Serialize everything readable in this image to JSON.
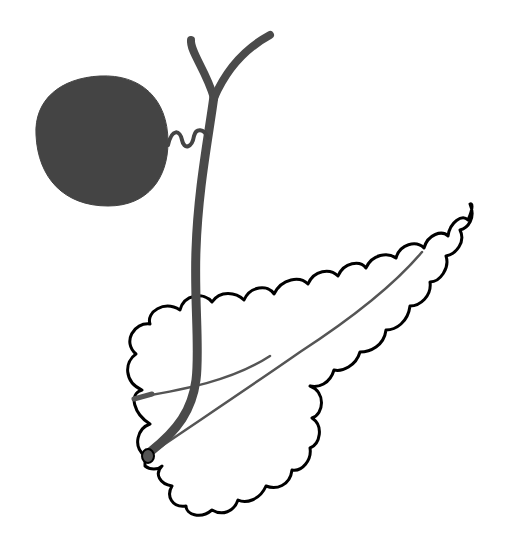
{
  "diagram": {
    "type": "anatomical-illustration",
    "subject": "Hepatobiliary and pancreatic duct system",
    "labels": [],
    "structures": [
      {
        "id": "gallbladder",
        "name": "Gallbladder",
        "style": "filled",
        "color": "#444444"
      },
      {
        "id": "cystic-duct",
        "name": "Cystic duct",
        "style": "wavy-line",
        "color": "#444444"
      },
      {
        "id": "hepatic-ducts",
        "name": "Right and left hepatic ducts",
        "style": "thick-line",
        "color": "#4a4a4a"
      },
      {
        "id": "common-bile-duct",
        "name": "Common bile duct",
        "style": "thick-line",
        "color": "#4a4a4a"
      },
      {
        "id": "pancreas",
        "name": "Pancreas",
        "style": "scalloped-outline",
        "stroke": "#000000",
        "fill": "#ffffff"
      },
      {
        "id": "main-pancreatic-duct",
        "name": "Main pancreatic duct",
        "style": "thin-line",
        "color": "#555555"
      },
      {
        "id": "accessory-pancreatic-duct",
        "name": "Accessory pancreatic duct",
        "style": "thin-line",
        "color": "#555555"
      },
      {
        "id": "ampulla",
        "name": "Ampulla of Vater",
        "style": "small-dot",
        "color": "#444444"
      }
    ]
  }
}
